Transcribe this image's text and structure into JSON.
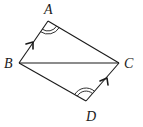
{
  "figure": {
    "type": "geometry-quadrilateral",
    "vertices": {
      "A": {
        "label": "A",
        "x": 48,
        "y": 21
      },
      "B": {
        "label": "B",
        "x": 19,
        "y": 63
      },
      "C": {
        "label": "C",
        "x": 119,
        "y": 63
      },
      "D": {
        "label": "D",
        "x": 86,
        "y": 101
      }
    },
    "segments": [
      "AB",
      "AC",
      "BC",
      "BD",
      "DC"
    ],
    "parallel_marks": [
      "BA",
      "DC"
    ],
    "angle_marks": [
      {
        "vertex": "A",
        "arcs": 2
      },
      {
        "vertex": "D",
        "arcs": 2
      }
    ],
    "colors": {
      "stroke": "#1a1a1a",
      "background": "#ffffff"
    }
  }
}
